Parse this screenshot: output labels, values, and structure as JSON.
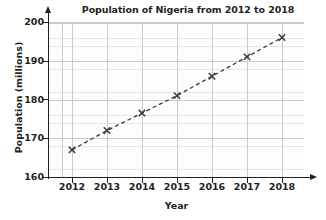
{
  "chart_data": {
    "type": "line",
    "title": "Population of Nigeria from 2012 to 2018",
    "xlabel": "Year",
    "ylabel": "Population (millions)",
    "categories": [
      "2012",
      "2013",
      "2014",
      "2015",
      "2016",
      "2017",
      "2018"
    ],
    "x": [
      2012,
      2013,
      2014,
      2015,
      2016,
      2017,
      2018
    ],
    "values": [
      167,
      172,
      176.5,
      181,
      186,
      191,
      196
    ],
    "series": [
      {
        "name": "Population of Nigeria",
        "values": [
          167,
          172,
          176.5,
          181,
          186,
          191,
          196
        ],
        "marker": "x",
        "line_style": "dashed",
        "color": "#3a3a3a"
      }
    ],
    "xlim": [
      2011.5,
      2018.7
    ],
    "ylim": [
      160,
      201
    ],
    "xticks": [
      "2012",
      "2013",
      "2014",
      "2015",
      "2016",
      "2017",
      "2018"
    ],
    "yticks": [
      "160",
      "170",
      "180",
      "190",
      "200"
    ],
    "ytick_values": [
      160,
      170,
      180,
      190,
      200
    ],
    "grid": true,
    "grid_minor": true,
    "legend": "none",
    "axis_arrows": true,
    "background": "#ffffff",
    "grid_color_major": "#c9c9cf",
    "grid_color_minor": "#e6e6ea",
    "axis_color": "#231f20"
  }
}
